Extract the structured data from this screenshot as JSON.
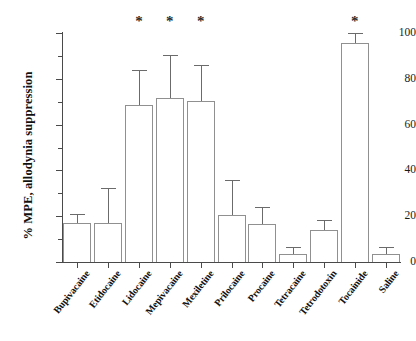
{
  "chart_data": {
    "type": "bar",
    "title": "",
    "subtitle": "",
    "xlabel": "",
    "ylabel": "% MPE, allodynia suppression",
    "ylim": [
      0,
      100
    ],
    "yticks": [
      0,
      20,
      40,
      60,
      80,
      100
    ],
    "ytick_labels": [
      "0",
      "20",
      "40",
      "60",
      "80",
      "100"
    ],
    "yminor_ticks": [
      10,
      30,
      50,
      70,
      90
    ],
    "grid": false,
    "legend": null,
    "legend_position": "none",
    "error_bars": "upper-only",
    "bar_style": {
      "fill": "#ffffff",
      "edge": "#909090",
      "error_color": "#6b6b6b"
    },
    "significance_marker": "*",
    "significance_note": "* marks treatments significantly different from saline",
    "categories": [
      "Bupivacaine",
      "Etidocaine",
      "Lidocaine",
      "Mepivacaine",
      "Mexiletine",
      "Prilocaine",
      "Procaine",
      "Tetracaine",
      "Tetrodotoxin",
      "Tocainide",
      "Saline"
    ],
    "values": [
      17,
      17,
      68.5,
      71.5,
      70.5,
      20.5,
      16.5,
      3.5,
      14,
      95.5,
      3.5
    ],
    "errors_upper": [
      21,
      32.5,
      84,
      90.5,
      86,
      36,
      24,
      6.5,
      18.5,
      100,
      6.5
    ],
    "significant": [
      false,
      false,
      true,
      true,
      true,
      false,
      false,
      false,
      false,
      true,
      false
    ]
  },
  "axis": {
    "y_title": "% MPE, allodynia suppression"
  }
}
